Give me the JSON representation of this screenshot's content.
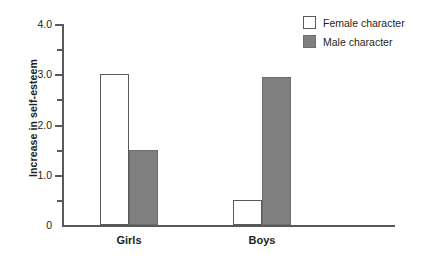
{
  "chart_data": {
    "type": "bar",
    "title": "",
    "subtitle": "",
    "xlabel": "",
    "ylabel": "Increase in self-esteem",
    "categories": [
      "Girls",
      "Boys"
    ],
    "series": [
      {
        "name": "Female character",
        "values": [
          3.0,
          0.5
        ],
        "color": "#ffffff"
      },
      {
        "name": "Male character",
        "values": [
          1.5,
          2.95
        ],
        "color": "#808080"
      }
    ],
    "ylim": [
      0,
      4.0
    ],
    "yticks": [
      "0",
      "1.0",
      "2.0",
      "3.0",
      "4.0"
    ],
    "ytick_values": [
      0,
      1.0,
      2.0,
      3.0,
      4.0
    ],
    "yminor_tick_values": [
      0.5,
      1.5,
      2.5,
      3.5
    ],
    "grid": false,
    "legend_position": "top-right",
    "annotations": []
  },
  "axis": {
    "y_title": "Increase in self-esteem",
    "tick_labels": [
      "4.0",
      "3.0",
      "2.0",
      "1.0",
      "0"
    ]
  },
  "categories": {
    "girls": "Girls",
    "boys": "Boys"
  },
  "legend": {
    "items": [
      {
        "label": "Female character",
        "swatch": "female-swatch"
      },
      {
        "label": "Male character",
        "swatch": "male-swatch"
      }
    ]
  },
  "colors": {
    "male_fill": "#808080",
    "female_fill": "#ffffff",
    "axis": "#58595b",
    "text": "#231f20"
  }
}
